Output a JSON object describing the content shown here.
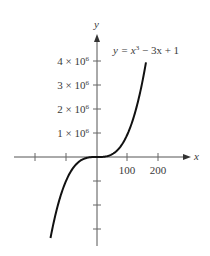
{
  "chart_data": {
    "type": "line",
    "title": "",
    "equation_label": "y = x³ − 3x + 1",
    "xlabel": "x",
    "ylabel": "y",
    "x_tick_labels": [
      "100",
      "200"
    ],
    "x_ticks": [
      -300,
      -200,
      100,
      200
    ],
    "y_tick_labels": [
      "1 × 10⁶",
      "2 × 10⁶",
      "3 × 10⁶",
      "4 × 10⁶"
    ],
    "y_ticks": [
      -3000000,
      -2000000,
      -1000000,
      1000000,
      2000000,
      3000000,
      4000000
    ],
    "xlim": [
      -270,
      310
    ],
    "ylim": [
      -3500000,
      5000000
    ],
    "grid": false,
    "legend": null,
    "series": [
      {
        "name": "y = x³ − 3x + 1",
        "x": [
          -150,
          -125,
          -100,
          -75,
          -50,
          -25,
          0,
          25,
          50,
          75,
          100,
          125,
          150,
          158
        ],
        "values": [
          -3374549,
          -1952749,
          -999699,
          -421649,
          -124849,
          -15549,
          1,
          15551,
          124851,
          421651,
          1000301,
          1953501,
          3375451,
          3944039
        ]
      }
    ]
  },
  "labels": {
    "y_axis": "y",
    "x_axis": "x",
    "equation_prefix": "y = x",
    "equation_exp": "3",
    "equation_suffix": " − 3x + 1",
    "x100": "100",
    "x200": "200",
    "y1_mant": "1 × 10",
    "y2_mant": "2 × 10",
    "y3_mant": "3 × 10",
    "y4_mant": "4 × 10",
    "y_exp": "6"
  }
}
